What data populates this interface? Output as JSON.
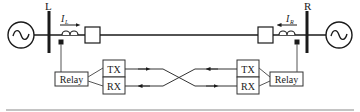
{
  "diagram": {
    "type": "two-terminal line differential protection scheme",
    "left_terminal": {
      "bus_label": "L",
      "current_label": "I",
      "current_subscript": "L",
      "relay_label": "Relay",
      "tx_label": "TX",
      "rx_label": "RX"
    },
    "right_terminal": {
      "bus_label": "R",
      "current_label": "I",
      "current_subscript": "R",
      "relay_label": "Relay",
      "tx_label": "TX",
      "rx_label": "RX"
    },
    "colors": {
      "stroke": "#1a1a1a",
      "box_stroke": "#333333",
      "bottom_rule": "#b0b0b0"
    }
  }
}
